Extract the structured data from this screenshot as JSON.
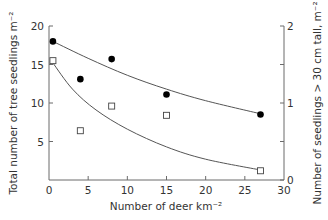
{
  "chart_data": {
    "type": "scatter",
    "title": "",
    "xlabel": "Number of deer km⁻²",
    "ylabel": "Total number of tree seedlings m⁻²",
    "ylabel_right": "Number of seedlings > 30 cm tall, m⁻²",
    "xlim": [
      0,
      30
    ],
    "ylim": [
      0,
      20
    ],
    "ylim_right": [
      0,
      2
    ],
    "x_ticks": [
      0,
      5,
      10,
      15,
      20,
      25,
      30
    ],
    "y_ticks": [
      5,
      10,
      15,
      20
    ],
    "y_tick_labels": [
      "5",
      "10",
      "15",
      "20"
    ],
    "y_ticks_right": [
      0,
      1,
      2
    ],
    "y_minor_ticks_right": [
      0.5,
      1.5
    ],
    "grid": false,
    "legend": null,
    "series": [
      {
        "name": "Total tree seedlings (left axis)",
        "marker": "filled-circle",
        "axis": "left",
        "x": [
          0.5,
          4,
          8,
          15,
          27
        ],
        "y": [
          18,
          13.1,
          15.7,
          11.1,
          8.5
        ],
        "fit_curve": {
          "x": [
            0.5,
            5,
            10,
            15,
            20,
            27
          ],
          "y": [
            18,
            15.8,
            13.6,
            11.8,
            10.3,
            8.6
          ]
        }
      },
      {
        "name": "Seedlings > 30 cm tall (right axis)",
        "marker": "open-square",
        "axis": "right",
        "x": [
          0.5,
          4,
          8,
          15,
          27
        ],
        "y": [
          1.55,
          0.64,
          0.96,
          0.84,
          0.12
        ],
        "fit_curve": {
          "x": [
            0.5,
            3,
            6,
            10,
            15,
            20,
            27
          ],
          "y": [
            1.52,
            1.18,
            0.91,
            0.66,
            0.43,
            0.27,
            0.13
          ]
        }
      }
    ]
  }
}
